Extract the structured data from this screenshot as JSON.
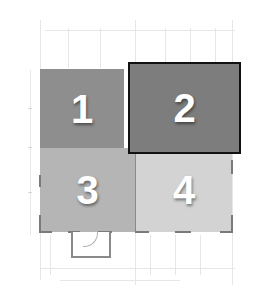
{
  "diagram": {
    "type": "floor-plan",
    "rooms": [
      {
        "id": "1",
        "label": "1",
        "color": "#8e8e8e",
        "highlighted": false
      },
      {
        "id": "2",
        "label": "2",
        "color": "#7d7d7d",
        "highlighted": true,
        "border_color": "#111111"
      },
      {
        "id": "3",
        "label": "3",
        "color": "#b5b5b5",
        "highlighted": false
      },
      {
        "id": "4",
        "label": "4",
        "color": "#d3d3d3",
        "highlighted": false
      }
    ],
    "background": "#ffffff",
    "guide_color": "#e6e6e6"
  }
}
